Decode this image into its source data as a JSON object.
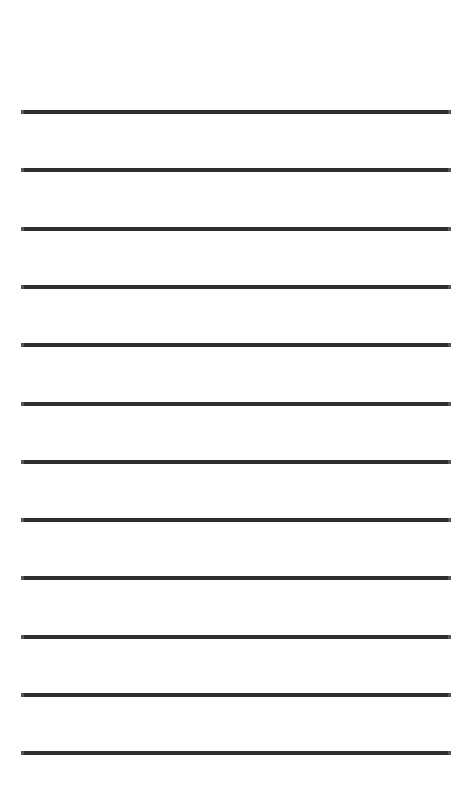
{
  "document": {
    "kind": "lined-writing-paper",
    "title": "Blank Ruled Paper",
    "page_width": 472,
    "page_height": 809,
    "background_color": "#ffffff",
    "text_content": "",
    "margin_note": ""
  },
  "ruling": {
    "line_count": 12,
    "line_color": "#2e2e2e",
    "line_thickness_px": 4,
    "line_left_px": 21,
    "line_right_px": 451,
    "line_width_px": 430,
    "first_line_y_px": 110,
    "line_spacing_px": 58.3,
    "top_margin_px": 110,
    "bottom_margin_px": 47,
    "lines": [
      {
        "index": 1,
        "y": 110,
        "label": "rule-line-1"
      },
      {
        "index": 2,
        "y": 168.3,
        "label": "rule-line-2"
      },
      {
        "index": 3,
        "y": 226.6,
        "label": "rule-line-3"
      },
      {
        "index": 4,
        "y": 284.9,
        "label": "rule-line-4"
      },
      {
        "index": 5,
        "y": 343.2,
        "label": "rule-line-5"
      },
      {
        "index": 6,
        "y": 401.5,
        "label": "rule-line-6"
      },
      {
        "index": 7,
        "y": 459.8,
        "label": "rule-line-7"
      },
      {
        "index": 8,
        "y": 518.1,
        "label": "rule-line-8"
      },
      {
        "index": 9,
        "y": 576.4,
        "label": "rule-line-9"
      },
      {
        "index": 10,
        "y": 634.7,
        "label": "rule-line-10"
      },
      {
        "index": 11,
        "y": 693.0,
        "label": "rule-line-11"
      },
      {
        "index": 12,
        "y": 751.3,
        "label": "rule-line-12"
      }
    ]
  },
  "writing_areas": [
    {
      "index": 1,
      "placeholder": ""
    },
    {
      "index": 2,
      "placeholder": ""
    },
    {
      "index": 3,
      "placeholder": ""
    },
    {
      "index": 4,
      "placeholder": ""
    },
    {
      "index": 5,
      "placeholder": ""
    },
    {
      "index": 6,
      "placeholder": ""
    },
    {
      "index": 7,
      "placeholder": ""
    },
    {
      "index": 8,
      "placeholder": ""
    },
    {
      "index": 9,
      "placeholder": ""
    },
    {
      "index": 10,
      "placeholder": ""
    },
    {
      "index": 11,
      "placeholder": ""
    },
    {
      "index": 12,
      "placeholder": ""
    }
  ]
}
